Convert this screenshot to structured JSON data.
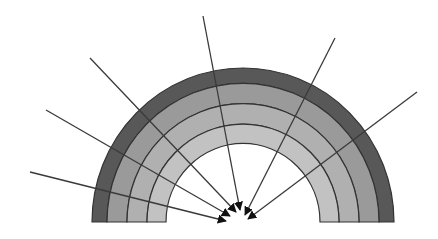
{
  "diagram": {
    "type": "semicircular-arch-with-converging-arrows",
    "center": [
      243,
      222
    ],
    "rings": [
      {
        "name": "outer-ring",
        "r_outer": 151,
        "r_inner": 136,
        "fill": "#585858"
      },
      {
        "name": "ring-2",
        "r_outer": 136,
        "r_inner": 116,
        "fill": "#9a9a9a"
      },
      {
        "name": "ring-3",
        "r_outer": 116,
        "r_inner": 96,
        "fill": "#b0b0b0"
      },
      {
        "name": "inner-ring",
        "r_outer": 96,
        "r_inner": 77,
        "fill": "#c2c2c2"
      }
    ],
    "stroke_color": "#333333",
    "arrow_color": "#3a3a3a",
    "arrows": [
      {
        "from": [
          30,
          172
        ],
        "to": [
          226,
          221
        ]
      },
      {
        "from": [
          46,
          110
        ],
        "to": [
          230,
          216
        ]
      },
      {
        "from": [
          90,
          58
        ],
        "to": [
          236,
          212
        ]
      },
      {
        "from": [
          203,
          16
        ],
        "to": [
          240,
          210
        ]
      },
      {
        "from": [
          335,
          38
        ],
        "to": [
          245,
          215
        ]
      },
      {
        "from": [
          417,
          92
        ],
        "to": [
          248,
          219
        ]
      }
    ]
  }
}
